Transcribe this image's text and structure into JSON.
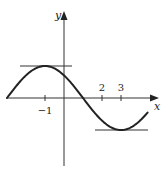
{
  "chart_data": {
    "type": "line",
    "title": "",
    "xlabel": "x",
    "ylabel": "y",
    "x_ticks": [
      -1,
      2,
      3
    ],
    "x_tick_labels": [
      "−1",
      "2",
      "3"
    ],
    "y_ticks": [],
    "function_description": "smooth sinusoid: zero at x=-3, local max at x=-1, zero at x=1, local min at x=3, rising toward x≈4.4",
    "key_points": [
      {
        "x": -3,
        "y": 0,
        "type": "start"
      },
      {
        "x": -1,
        "y": 1,
        "type": "local-max"
      },
      {
        "x": 1,
        "y": 0,
        "type": "zero-crossing"
      },
      {
        "x": 3,
        "y": -1,
        "type": "local-min"
      },
      {
        "x": 4.4,
        "y": -0.45,
        "type": "end"
      }
    ],
    "tangent_lines": [
      {
        "at_x": -1,
        "y": 1,
        "type": "horizontal",
        "x_range": [
          -2.3,
          0.4
        ]
      },
      {
        "at_x": 3,
        "y": -1,
        "type": "horizontal",
        "x_range": [
          1.6,
          4.4
        ]
      }
    ],
    "xlim": [
      -3.2,
      4.9
    ],
    "ylim": [
      -2.1,
      2.7
    ],
    "grid": false,
    "legend": null
  },
  "labels": {
    "x_axis": "x",
    "y_axis": "y",
    "tick_neg1": "−1",
    "tick_2": "2",
    "tick_3": "3"
  },
  "colors": {
    "curve": "#222222",
    "axes": "#333333",
    "tangents": "#333333",
    "background": "#ffffff"
  }
}
